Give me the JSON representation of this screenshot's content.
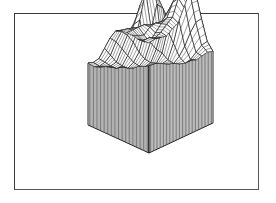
{
  "figure": {
    "frame": {
      "x": 14,
      "y": 13,
      "width": 245,
      "height": 177,
      "stroke": "#3a3a3a"
    },
    "ink_color": "#111111",
    "background": "#ffffff"
  },
  "chart_data": {
    "type": "surface3d",
    "title": "",
    "xlabel": "",
    "ylabel": "",
    "zlabel": "",
    "style": "wireframe surface with vertical hatch 'skirt' walls, oblique view from front corner",
    "projection": {
      "origin_front_bottom": [
        149,
        153
      ],
      "left_back_bottom": [
        88,
        125
      ],
      "right_back_bottom": [
        213,
        123
      ],
      "base_height_px": 76,
      "z_scale_px": 64
    },
    "grid_size": [
      12,
      12
    ],
    "z_range": [
      0,
      1.6
    ],
    "z": [
      [
        1.0,
        1.02,
        1.0,
        0.98,
        1.05,
        1.1,
        1.3,
        1.5,
        1.45,
        1.0,
        0.6,
        0.4
      ],
      [
        1.0,
        1.0,
        0.95,
        1.0,
        1.08,
        1.15,
        1.4,
        1.55,
        1.4,
        0.9,
        0.5,
        0.35
      ],
      [
        0.98,
        0.9,
        0.85,
        0.95,
        1.05,
        1.1,
        1.3,
        1.45,
        1.2,
        0.7,
        0.35,
        0.25
      ],
      [
        1.0,
        0.95,
        0.92,
        1.0,
        1.02,
        1.0,
        1.1,
        1.2,
        0.9,
        0.45,
        0.2,
        0.15
      ],
      [
        1.0,
        1.0,
        1.0,
        1.0,
        0.95,
        0.85,
        0.8,
        0.75,
        0.5,
        0.25,
        0.1,
        0.1
      ],
      [
        1.0,
        0.98,
        0.95,
        0.9,
        0.8,
        0.6,
        0.45,
        0.35,
        0.2,
        0.1,
        0.05,
        0.1
      ],
      [
        0.95,
        0.9,
        0.8,
        0.65,
        0.45,
        0.3,
        0.2,
        0.15,
        0.1,
        0.05,
        0.08,
        0.15
      ],
      [
        0.8,
        0.7,
        0.55,
        0.4,
        0.25,
        0.15,
        0.1,
        0.08,
        0.1,
        0.2,
        0.35,
        0.4
      ],
      [
        0.6,
        0.45,
        0.3,
        0.2,
        0.12,
        0.08,
        0.1,
        0.25,
        0.55,
        0.9,
        0.8,
        0.55
      ],
      [
        0.4,
        0.3,
        0.2,
        0.12,
        0.1,
        0.15,
        0.35,
        0.7,
        1.1,
        1.25,
        0.95,
        0.6
      ],
      [
        0.3,
        0.2,
        0.15,
        0.1,
        0.15,
        0.25,
        0.4,
        0.6,
        0.85,
        0.9,
        0.7,
        0.8
      ],
      [
        0.25,
        0.15,
        0.1,
        0.1,
        0.2,
        0.3,
        0.4,
        0.45,
        0.5,
        0.55,
        0.8,
        1.3
      ]
    ],
    "grid": false,
    "legend": null,
    "annotations": []
  }
}
